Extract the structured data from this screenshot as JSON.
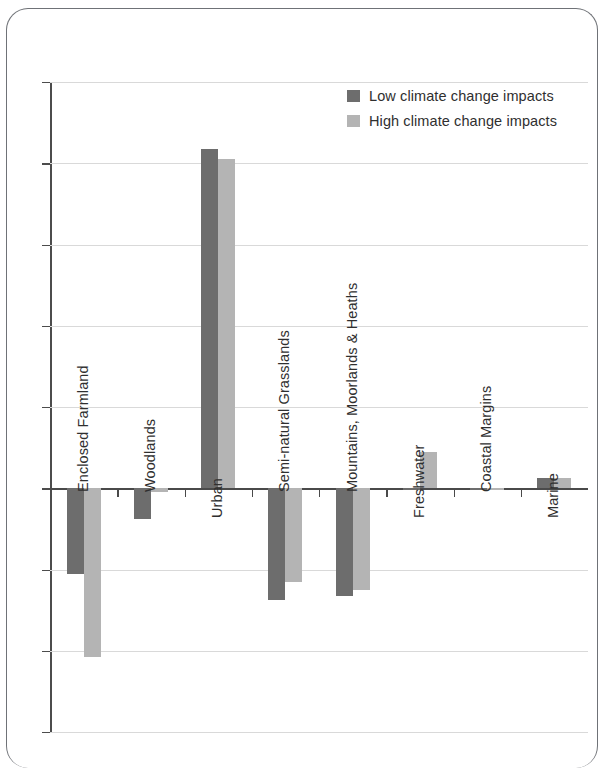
{
  "chart_data": {
    "type": "bar",
    "title": "",
    "subtitle": "",
    "xlabel": "",
    "ylabel": "",
    "ylim": [
      -6,
      10
    ],
    "ytick_values": [
      10,
      8,
      6,
      4,
      2,
      0,
      -2,
      -4,
      -6
    ],
    "ytick_labels": [
      "10%",
      "8%",
      "6%",
      "4%",
      "2%",
      "0%",
      "-2%",
      "-4%",
      "-6%"
    ],
    "grid": true,
    "legend_position": "top-right",
    "categories": [
      "Enclosed Farmland",
      "Woodlands",
      "Urban",
      "Semi-natural Grasslands",
      "Mountains, Moorlands & Heaths",
      "Freshwater",
      "Coastal Margins",
      "Marine"
    ],
    "series": [
      {
        "name": "Low climate change impacts",
        "color": "#6d6d6d",
        "values": [
          -2.1,
          -0.75,
          8.35,
          -2.75,
          -2.65,
          -0.05,
          -0.05,
          0.25
        ]
      },
      {
        "name": "High climate change impacts",
        "color": "#b4b4b4",
        "values": [
          -4.15,
          -0.08,
          8.1,
          -2.3,
          -2.5,
          0.9,
          -0.05,
          0.25
        ]
      }
    ]
  },
  "legend": {
    "items": [
      {
        "label": "Low climate change impacts",
        "color": "#6d6d6d"
      },
      {
        "label": "High climate change impacts",
        "color": "#b4b4b4"
      }
    ]
  },
  "axis": {
    "y_labels": [
      "10%",
      "8%",
      "6%",
      "4%",
      "2%",
      "0%",
      "-2%",
      "-4%",
      "-6%"
    ]
  },
  "bottom_text": ""
}
